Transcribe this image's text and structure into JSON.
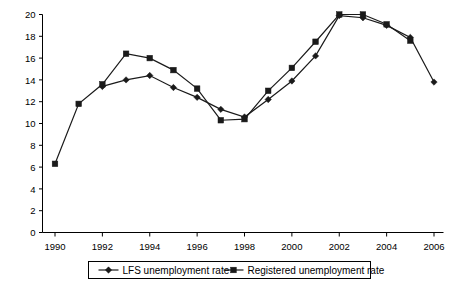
{
  "chart_data": {
    "type": "line",
    "title": "",
    "xlabel": "",
    "ylabel": "",
    "x": [
      1990,
      1991,
      1992,
      1993,
      1994,
      1995,
      1996,
      1997,
      1998,
      1999,
      2000,
      2001,
      2002,
      2003,
      2004,
      2005,
      2006
    ],
    "xtick_labels": [
      "1990",
      "1992",
      "1994",
      "1996",
      "1998",
      "2000",
      "2002",
      "2004",
      "2006"
    ],
    "xticks": [
      1990,
      1992,
      1994,
      1996,
      1998,
      2000,
      2002,
      2004,
      2006
    ],
    "ytick_labels": [
      "0",
      "2",
      "4",
      "6",
      "8",
      "10",
      "12",
      "14",
      "16",
      "18",
      "20"
    ],
    "yticks": [
      0,
      2,
      4,
      6,
      8,
      10,
      12,
      14,
      16,
      18,
      20
    ],
    "xlim": [
      1989.4,
      2006.6
    ],
    "ylim": [
      0,
      20
    ],
    "grid": false,
    "legend_position": "bottom",
    "series": [
      {
        "name": "LFS unemployment rate",
        "marker": "diamond",
        "color": "#1a1a1a",
        "x": [
          1992,
          1993,
          1994,
          1995,
          1996,
          1997,
          1998,
          1999,
          2000,
          2001,
          2002,
          2003,
          2004,
          2005,
          2006
        ],
        "values": [
          13.4,
          14.0,
          14.4,
          13.3,
          12.4,
          11.3,
          10.6,
          12.2,
          13.9,
          16.2,
          19.9,
          19.7,
          19.0,
          17.9,
          13.8
        ]
      },
      {
        "name": "Registered unemployment rate",
        "marker": "square",
        "color": "#1a1a1a",
        "x": [
          1990,
          1991,
          1992,
          1993,
          1994,
          1995,
          1996,
          1997,
          1998,
          1999,
          2000,
          2001,
          2002,
          2003,
          2004,
          2005
        ],
        "values": [
          6.3,
          11.8,
          13.6,
          16.4,
          16.0,
          14.9,
          13.2,
          10.3,
          10.4,
          13.0,
          15.1,
          17.5,
          20.0,
          20.0,
          19.1,
          17.6
        ]
      }
    ],
    "legend": [
      "LFS unemployment rate",
      "Registered unemployment rate"
    ]
  }
}
